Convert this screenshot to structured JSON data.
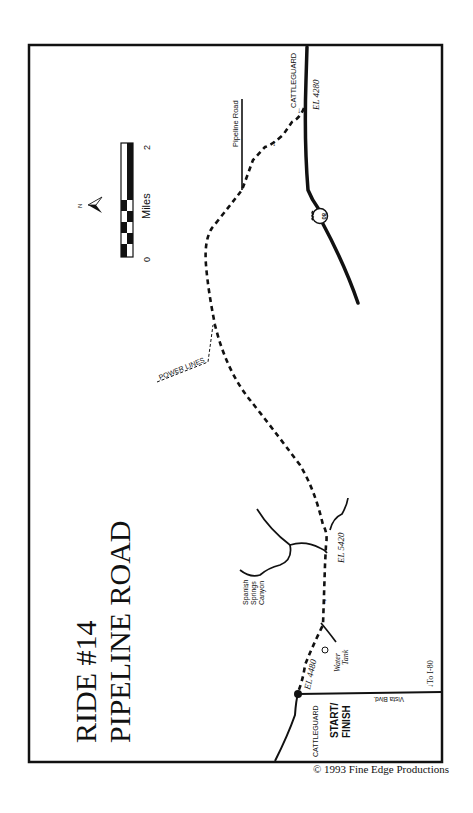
{
  "title": {
    "line1": "RIDE #14",
    "line2": "PIPELINE ROAD"
  },
  "credit": "© 1993 Fine Edge Productions",
  "labels": {
    "cattleguard_north": "CATTLEGUARD",
    "elevation_north": "EL 4280",
    "pipeline_road": "Pipeline Road",
    "highway_shield": "80",
    "power_lines": "POWER LINES",
    "spanish_springs_1": "Spanish",
    "spanish_springs_2": "Springs",
    "spanish_springs_3": "Canyon",
    "elevation_mid": "EL 5420",
    "water_tank_1": "Water",
    "water_tank_2": "Tank",
    "elevation_start": "EL 4480",
    "cattleguard_start": "CATTLEGUARD",
    "start_1": "START/",
    "start_2": "FINISH",
    "vista_blvd": "Vista Blvd.",
    "to_i80": "To I-80"
  },
  "scale": {
    "unit": "Miles",
    "min": "0",
    "max": "2",
    "north": "N"
  },
  "colors": {
    "ink": "#111111",
    "paper": "#ffffff"
  }
}
